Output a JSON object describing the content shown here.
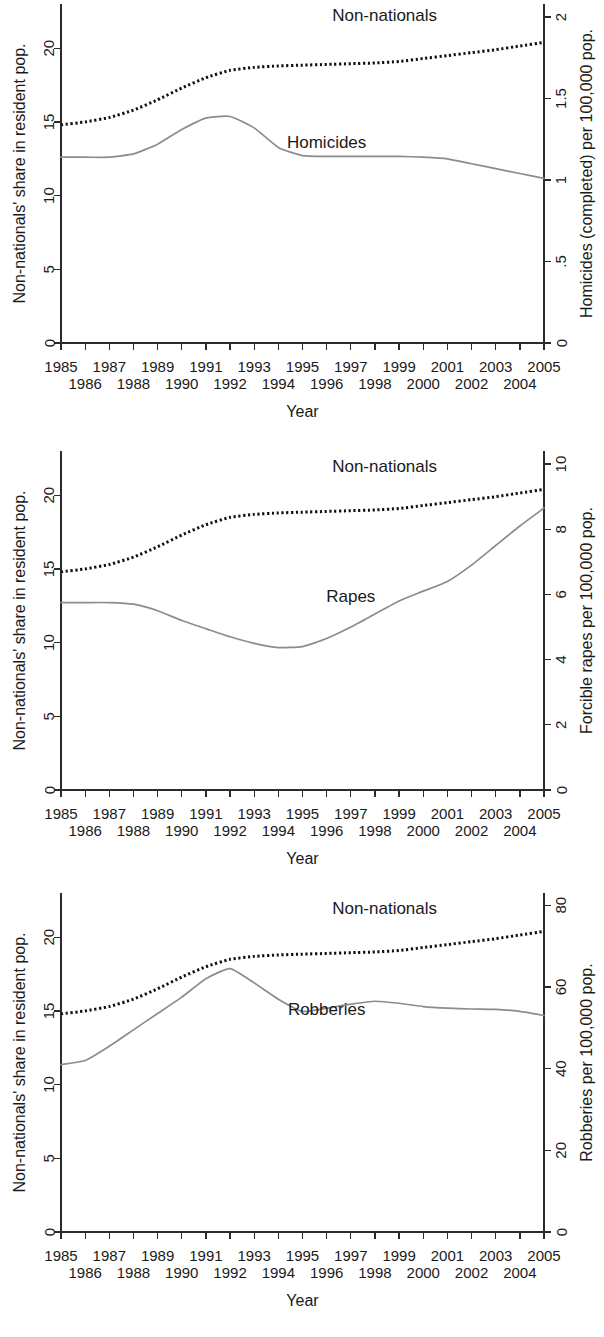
{
  "figure": {
    "panel_count": 3,
    "background": "#ffffff",
    "line_color_solid": "#8c8c8c",
    "line_color_dotted": "#111111"
  },
  "common": {
    "xlabel": "Year",
    "left_ylabel": "Non-nationals' share in resident pop.",
    "left_ticks": [
      "0",
      "5",
      "10",
      "15",
      "20"
    ],
    "left_tick_values": [
      0,
      5,
      10,
      15,
      20
    ],
    "left_ylim": [
      0,
      23
    ],
    "x_ticks_top": [
      "1985",
      "1987",
      "1989",
      "1991",
      "1993",
      "1995",
      "1997",
      "1999",
      "2001",
      "2003",
      "2005"
    ],
    "x_ticks_bottom": [
      "1986",
      "1988",
      "1990",
      "1992",
      "1994",
      "1996",
      "1998",
      "2000",
      "2002",
      "2004"
    ],
    "xlim": [
      1985,
      2005
    ],
    "nonnationals_label": "Non-nationals"
  },
  "chart_data": [
    {
      "type": "line",
      "title": "",
      "xlabel": "Year",
      "ylabel": "Non-nationals' share in resident pop.",
      "y2label": "Homicides (completed) per 100,000 pop.",
      "grid": false,
      "legend": "inline-annotations",
      "x": [
        1985,
        1986,
        1987,
        1988,
        1989,
        1990,
        1991,
        1992,
        1993,
        1994,
        1995,
        1996,
        1997,
        1998,
        1999,
        2000,
        2001,
        2002,
        2003,
        2004,
        2005
      ],
      "xlim": [
        1985,
        2005
      ],
      "ylim": [
        0,
        23
      ],
      "y2lim": [
        0,
        2.08
      ],
      "y2_ticks": [
        "0",
        ".5",
        "1",
        "1.5",
        "2"
      ],
      "y2_tick_values": [
        0,
        0.5,
        1,
        1.5,
        2
      ],
      "series": [
        {
          "name": "Non-nationals",
          "style": "dotted",
          "axis": "left",
          "values": [
            14.8,
            15.0,
            15.3,
            15.8,
            16.5,
            17.3,
            18.0,
            18.5,
            18.7,
            18.8,
            18.85,
            18.9,
            18.95,
            19.0,
            19.1,
            19.3,
            19.5,
            19.7,
            19.9,
            20.15,
            20.4
          ]
        },
        {
          "name": "Homicides",
          "style": "solid",
          "axis": "right",
          "values": [
            1.14,
            1.14,
            1.14,
            1.16,
            1.22,
            1.31,
            1.38,
            1.39,
            1.32,
            1.2,
            1.15,
            1.145,
            1.145,
            1.145,
            1.145,
            1.14,
            1.13,
            1.1,
            1.07,
            1.04,
            1.01
          ]
        }
      ],
      "annotations": [
        {
          "text": "Non-nationals",
          "x_frac": 0.67,
          "y_frac": 0.035
        },
        {
          "text": "Homicides",
          "x_frac": 0.55,
          "y_frac": 0.41
        }
      ]
    },
    {
      "type": "line",
      "title": "",
      "xlabel": "Year",
      "ylabel": "Non-nationals' share in resident pop.",
      "y2label": "Forcible rapes per 100,000 pop.",
      "grid": false,
      "legend": "inline-annotations",
      "x": [
        1985,
        1986,
        1987,
        1988,
        1989,
        1990,
        1991,
        1992,
        1993,
        1994,
        1995,
        1996,
        1997,
        1998,
        1999,
        2000,
        2001,
        2002,
        2003,
        2004,
        2005
      ],
      "xlim": [
        1985,
        2005
      ],
      "ylim": [
        0,
        23
      ],
      "y2lim": [
        0,
        10.4
      ],
      "y2_ticks": [
        "0",
        "2",
        "4",
        "6",
        "8",
        "10"
      ],
      "y2_tick_values": [
        0,
        2,
        4,
        6,
        8,
        10
      ],
      "series": [
        {
          "name": "Non-nationals",
          "style": "dotted",
          "axis": "left",
          "values": [
            14.8,
            15.0,
            15.3,
            15.8,
            16.5,
            17.3,
            18.0,
            18.5,
            18.7,
            18.8,
            18.85,
            18.9,
            18.95,
            19.0,
            19.1,
            19.3,
            19.5,
            19.7,
            19.9,
            20.15,
            20.4
          ]
        },
        {
          "name": "Rapes",
          "style": "solid",
          "axis": "right",
          "values": [
            5.75,
            5.75,
            5.75,
            5.7,
            5.5,
            5.2,
            4.95,
            4.7,
            4.5,
            4.37,
            4.4,
            4.65,
            5.0,
            5.4,
            5.8,
            6.1,
            6.4,
            6.9,
            7.5,
            8.1,
            8.65
          ]
        }
      ],
      "annotations": [
        {
          "text": "Non-nationals",
          "x_frac": 0.67,
          "y_frac": 0.045
        },
        {
          "text": "Rapes",
          "x_frac": 0.6,
          "y_frac": 0.43
        }
      ]
    },
    {
      "type": "line",
      "title": "",
      "xlabel": "Year",
      "ylabel": "Non-nationals' share in resident pop.",
      "y2label": "Robberies per 100,000 pop.",
      "grid": false,
      "legend": "inline-annotations",
      "x": [
        1985,
        1986,
        1987,
        1988,
        1989,
        1990,
        1991,
        1992,
        1993,
        1994,
        1995,
        1996,
        1997,
        1998,
        1999,
        2000,
        2001,
        2002,
        2003,
        2004,
        2005
      ],
      "xlim": [
        1985,
        2005
      ],
      "ylim": [
        0,
        23
      ],
      "y2lim": [
        0,
        83
      ],
      "y2_ticks": [
        "0",
        "20",
        "40",
        "60",
        "80"
      ],
      "y2_tick_values": [
        0,
        20,
        40,
        60,
        80
      ],
      "series": [
        {
          "name": "Non-nationals",
          "style": "dotted",
          "axis": "left",
          "values": [
            14.8,
            15.0,
            15.3,
            15.8,
            16.5,
            17.3,
            18.0,
            18.5,
            18.7,
            18.8,
            18.85,
            18.9,
            18.95,
            19.0,
            19.1,
            19.3,
            19.5,
            19.7,
            19.9,
            20.15,
            20.4
          ]
        },
        {
          "name": "Robberies",
          "style": "solid",
          "axis": "right",
          "values": [
            41.0,
            42.0,
            45.5,
            49.5,
            53.5,
            57.5,
            62.0,
            64.5,
            61.0,
            57.0,
            54.0,
            54.8,
            55.8,
            56.5,
            56.0,
            55.2,
            54.8,
            54.6,
            54.5,
            54.0,
            53.0
          ]
        }
      ],
      "annotations": [
        {
          "text": "Non-nationals",
          "x_frac": 0.67,
          "y_frac": 0.045
        },
        {
          "text": "Robberies",
          "x_frac": 0.55,
          "y_frac": 0.345
        }
      ]
    }
  ]
}
